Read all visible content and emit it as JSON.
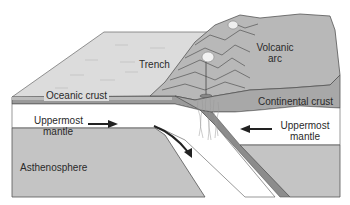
{
  "diagram": {
    "type": "subduction-zone-block-diagram",
    "labels": {
      "trench": "Trench",
      "volcanic_arc_line1": "Volcanic",
      "volcanic_arc_line2": "arc",
      "oceanic_crust": "Oceanic crust",
      "continental_crust": "Continental crust",
      "uppermost_mantle_left_line1": "Uppermost",
      "uppermost_mantle_left_line2": "mantle",
      "uppermost_mantle_right_line1": "Uppermost",
      "uppermost_mantle_right_line2": "mantle",
      "asthenosphere": "Asthenosphere"
    },
    "arrows": [
      {
        "name": "left-mantle-arrow",
        "direction": "right"
      },
      {
        "name": "right-mantle-arrow",
        "direction": "left"
      },
      {
        "name": "subduction-arrow",
        "direction": "down-right"
      }
    ],
    "colors": {
      "ocean_surface": "#dcdcdc",
      "oceanic_crust": "#9a9a9a",
      "mountains": "#b8b8b8",
      "continental_crust": "#a8a8a8",
      "mantle": "#ffffff",
      "asthenosphere": "#c4c4c4",
      "outline": "#555555",
      "arrow": "#222222"
    }
  }
}
